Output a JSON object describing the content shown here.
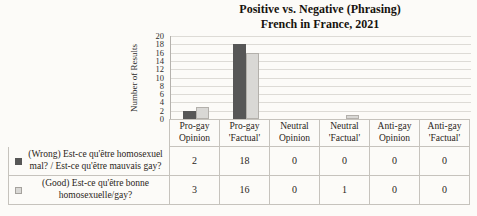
{
  "chart_data": {
    "type": "bar",
    "title": "Positive vs. Negative (Phrasing)",
    "subtitle": "French in France, 2021",
    "xlabel": "",
    "ylabel": "Number of Results",
    "ylim": [
      0,
      20
    ],
    "ytick_step": 2,
    "yticks": [
      20,
      18,
      16,
      14,
      12,
      10,
      8,
      6,
      4,
      2,
      0
    ],
    "grid": true,
    "legend_position": "table-below-chart",
    "categories": [
      "Pro-gay Opinion",
      "Pro-gay 'Factual'",
      "Neutral Opinion",
      "Neutral 'Factual'",
      "Anti-gay Opinion",
      "Anti-gay 'Factual'"
    ],
    "series": [
      {
        "name": "(Wrong) Est-ce qu'être homosexuel mal? / Est-ce qu'être mauvais gay?",
        "color": "#575757",
        "values": [
          2,
          18,
          0,
          0,
          0,
          0
        ]
      },
      {
        "name": "(Good) Est-ce qu'être bonne homosexuelle/gay?",
        "color": "#d9d8d5",
        "values": [
          3,
          16,
          0,
          1,
          0,
          0
        ]
      }
    ]
  },
  "colors": {
    "series1": "#575757",
    "series2": "#d9d8d5",
    "gridline": "#dddbd6",
    "table_border": "#c6c3bd",
    "background": "#fcfbf8"
  }
}
